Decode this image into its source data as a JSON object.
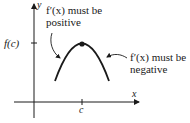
{
  "diagram": {
    "type": "function-graph",
    "axes": {
      "x_label": "x",
      "y_label": "y"
    },
    "ticks": {
      "y_tick_label": "f(c)",
      "x_tick_label": "c"
    },
    "annotations": {
      "left": {
        "line1": "f′(x) must be",
        "line2": "positive"
      },
      "right": {
        "line1": "f′(x) must be",
        "line2": "negative"
      }
    },
    "points": [
      {
        "name": "maximum",
        "x_label": "c",
        "y_label": "f(c)"
      }
    ],
    "colors": {
      "ink": "#1a1a1a",
      "background": "#ffffff"
    }
  }
}
